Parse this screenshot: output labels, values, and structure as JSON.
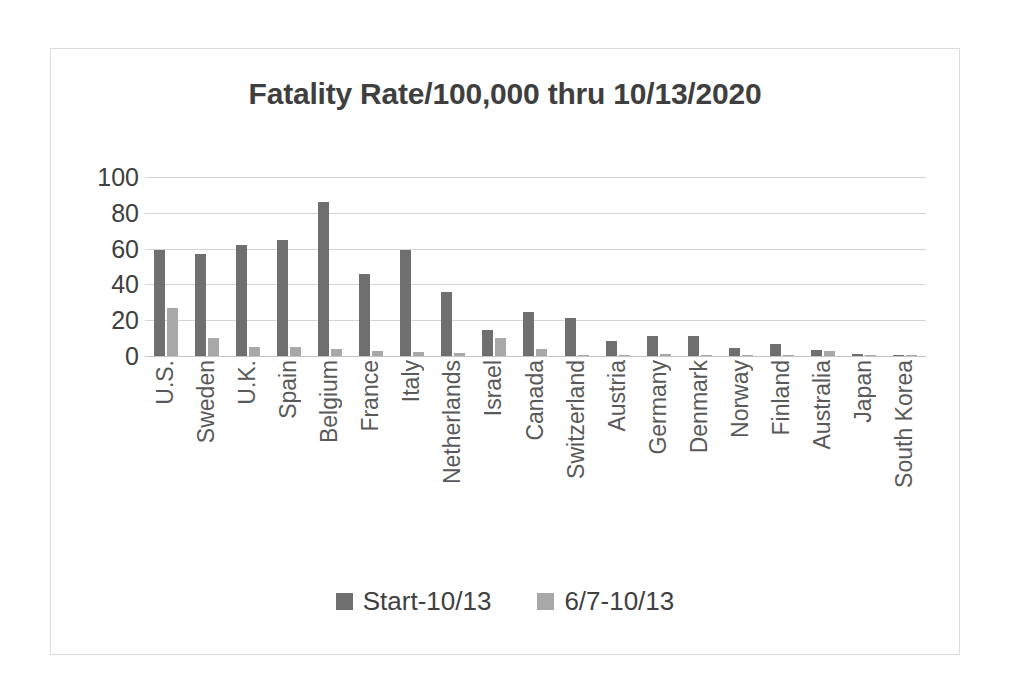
{
  "chart_data": {
    "type": "bar",
    "title": "Fatality Rate/100,000 thru 10/13/2020",
    "xlabel": "",
    "ylabel": "",
    "ylim": [
      0,
      100
    ],
    "yticks": [
      100,
      80,
      60,
      40,
      20,
      0
    ],
    "grid": true,
    "legend_position": "bottom",
    "categories": [
      "U.S.",
      "Sweden",
      "U.K.",
      "Spain",
      "Belgium",
      "France",
      "Italy",
      "Netherlands",
      "Israel",
      "Canada",
      "Switzerland",
      "Austria",
      "Germany",
      "Denmark",
      "Norway",
      "Finland",
      "Australia",
      "Japan",
      "South Korea"
    ],
    "series": [
      {
        "name": "Start-10/13",
        "color": "#6f6f6f",
        "values": [
          59,
          57,
          62,
          65,
          86,
          46,
          59,
          36,
          14.5,
          24.5,
          21,
          8.5,
          11,
          11,
          4.5,
          6.5,
          3.5,
          1.3,
          0.8
        ]
      },
      {
        "name": "6/7-10/13",
        "color": "#a8a8a8",
        "values": [
          27,
          10,
          5,
          5,
          4,
          3,
          2.5,
          1.5,
          10,
          4,
          0.8,
          0.6,
          1.2,
          0.6,
          0.4,
          0.5,
          2.8,
          0.6,
          0.5
        ]
      }
    ]
  },
  "colors": {
    "series_dark": "#6f6f6f",
    "series_light": "#a8a8a8",
    "gridline": "#d4d4d4",
    "frame_border": "#dcdcdc",
    "title_text": "#3f3f3f",
    "axis_text": "#404040",
    "category_text": "#595959"
  }
}
